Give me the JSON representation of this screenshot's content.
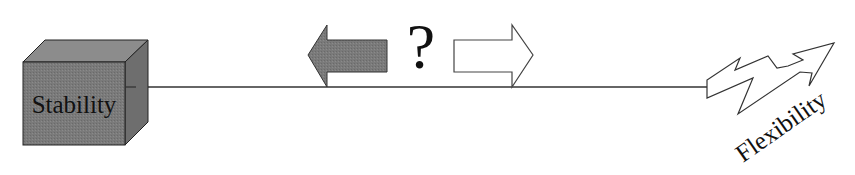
{
  "diagram": {
    "left_node": {
      "label": "Stability",
      "shape": "cube",
      "fill": "#7a7a7a"
    },
    "right_node": {
      "label": "Flexibility",
      "shape": "zigzag-arrow-icon"
    },
    "middle": {
      "question": "?",
      "left_arrow": {
        "direction": "left",
        "fill": "#7d7d7d"
      },
      "right_arrow": {
        "direction": "right",
        "fill": "#ffffff"
      }
    },
    "axis_line_color": "#333333"
  }
}
